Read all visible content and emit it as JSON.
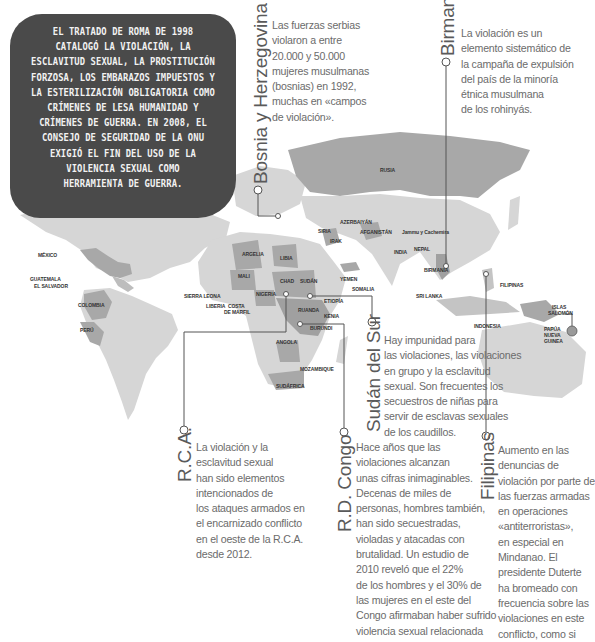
{
  "intro_box": {
    "lines": [
      "El Tratado de Roma de 1998",
      "catalogó la violación, la",
      "esclavitud sexual, la prostitución",
      "forzosa, los embarazos impuestos y",
      "la esterilización obligatoria como",
      "crímenes de lesa humanidad y",
      "crímenes de guerra. En 2008, el",
      "Consejo de Seguridad de la ONU",
      "exigió el fin del uso de la",
      "violencia sexual como",
      "herramienta de guerra."
    ]
  },
  "callouts": {
    "bosnia": {
      "title": "Bosnia y Herzegovina",
      "lines": [
        "Las fuerzas serbias",
        "violaron a entre",
        "20.000 y 50.000",
        "mujeres musulmanas",
        "(bosnias) en 1992,",
        "muchas en «campos",
        "de violación»."
      ]
    },
    "birmania": {
      "title": "Birmania",
      "lines": [
        "La violación es un",
        "elemento sistemático de",
        "la campaña de expulsión",
        "del país de la minoría",
        "étnica musulmana",
        "de los rohinyás."
      ]
    },
    "sudan_sur": {
      "title": "Sudán del Sur",
      "lines": [
        "Hay impunidad para",
        "las violaciones, las violaciones",
        "en grupo y la esclavitud",
        "sexual. Son frecuentes los",
        "secuestros de niñas para",
        "servir de esclavas sexuales",
        "de los caudillos."
      ]
    },
    "rca": {
      "title": "R.C.A.",
      "lines": [
        "La violación y la",
        "esclavitud sexual",
        "han sido elementos",
        "intencionados de",
        "los ataques armados en",
        "el encarnizado conflicto",
        "en el oeste de la R.C.A.",
        "desde 2012."
      ]
    },
    "rdcongo": {
      "title": "R.D. Congo",
      "lines": [
        "Hace años que las",
        "violaciones alcanzan",
        "unas cifras inimaginables.",
        "Decenas de miles de",
        "personas, hombres también,",
        "han sido secuestradas,",
        "violadas y atacadas con",
        "brutalidad. Un estudio de",
        "2010 reveló que el 22%",
        "de los hombres y el 30% de",
        "las mujeres en el este del",
        "Congo afirmaban haber sufrido",
        "violencia sexual relacionada"
      ]
    },
    "filipinas": {
      "title": "Filipinas",
      "lines": [
        "Aumento en las",
        "denuncias de",
        "violación por parte de",
        "las fuerzas armadas",
        "en operaciones",
        "«antiterroristas»,",
        "en especial en",
        "Mindanao. El",
        "presidente Duterte",
        "ha bromeado con",
        "frecuencia sobre las",
        "violaciones en este",
        "conflicto, como si"
      ]
    }
  },
  "map_labels": {
    "rusia": "RUSIA",
    "azerbaiyan": "AZERBAIYÁN",
    "siria": "SIRIA",
    "irak": "IRAK",
    "afganistan": "AFGANISTÁN",
    "jammu": "Jammu y Cachemira",
    "nepal": "NEPAL",
    "india": "INDIA",
    "birmania": "BIRMANIA",
    "sri_lanka": "SRI LANKA",
    "yemen": "YEMEN",
    "somalia": "SOMALIA",
    "etiopia": "ETIOPÍA",
    "kenia": "KENIA",
    "sudan": "SUDÁN",
    "chad": "CHAD",
    "libia": "LIBIA",
    "argelia": "ARGELIA",
    "mali": "MALI",
    "nigeria": "NIGERIA",
    "sierra_leona": "SIERRA LEONA",
    "liberia": "LIBERIA",
    "costa_marfil_1": "COSTA",
    "costa_marfil_2": "DE MARFIL",
    "ruanda": "RUANDA",
    "burundi": "BURUNDI",
    "angola": "ANGOLA",
    "mozambique": "MOZAMBIQUE",
    "sudafrica": "SUDÁFRICA",
    "mexico": "MÉXICO",
    "guatemala": "GUATEMALA",
    "el_salvador": "EL SALVADOR",
    "colombia": "COLOMBIA",
    "peru": "PERÚ",
    "filipinas": "FILIPINAS",
    "indonesia": "INDONESIA",
    "islas_salomon_1": "ISLAS",
    "islas_salomon_2": "SALOMÓN",
    "png_1": "PAPÚA",
    "png_2": "NUEVA",
    "png_3": "GUINEA"
  },
  "colors": {
    "land_light": "#d6d6d6",
    "land_mid": "#b4b4b4",
    "land_dark": "#9a9a9a",
    "box_bg": "#4a4a4a",
    "line": "#555555",
    "text": "#6b6b6b"
  }
}
